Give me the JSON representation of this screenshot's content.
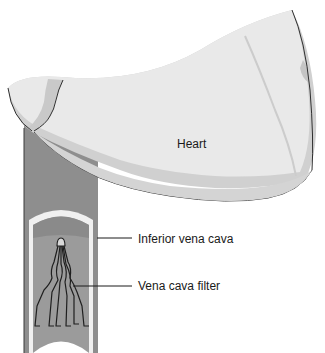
{
  "diagram": {
    "labels": {
      "heart": "Heart",
      "inferior_vena_cava": "Inferior vena cava",
      "vena_cava_filter": "Vena cava filter"
    },
    "colors": {
      "heart_fill": "#e8e8e8",
      "heart_shadow": "#cfcfcf",
      "vessel_wall": "#8c8c8c",
      "vessel_lumen": "#9e9e9e",
      "vessel_highlight": "#f2f2f2",
      "outline": "#2a2a2a",
      "background": "#ffffff"
    }
  }
}
